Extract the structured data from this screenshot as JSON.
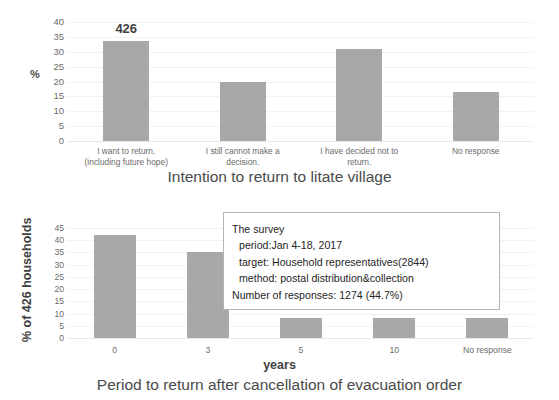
{
  "chart_data": [
    {
      "id": "intention",
      "type": "bar",
      "title": "Intention to return to litate village",
      "xlabel": "",
      "ylabel": "%",
      "ylim": [
        0,
        40
      ],
      "yticks": [
        40,
        35,
        30,
        25,
        20,
        15,
        10,
        5,
        0
      ],
      "grid": true,
      "categories": [
        "I want to return.\n(including future hope)",
        "I still cannot make a\ndecision.",
        "I have decided not to\nreturn.",
        "No response"
      ],
      "category_lines": [
        [
          "I want to return.",
          "(including future hope)"
        ],
        [
          "I still cannot make a",
          "decision."
        ],
        [
          "I have decided not to",
          "return."
        ],
        [
          "No response"
        ]
      ],
      "values": [
        33.5,
        20.0,
        31.0,
        16.5
      ],
      "annotations": [
        {
          "bar_index": 0,
          "text": "426"
        }
      ]
    },
    {
      "id": "period",
      "type": "bar",
      "title": "Period to return after cancellation of evacuation order",
      "xlabel": "years",
      "ylabel": "% of 426 households",
      "ylim": [
        0,
        45
      ],
      "yticks": [
        45,
        40,
        35,
        30,
        25,
        20,
        15,
        10,
        5,
        0
      ],
      "grid": true,
      "categories": [
        "0",
        "3",
        "5",
        "10",
        "No response"
      ],
      "category_lines": [
        [
          "0"
        ],
        [
          "3"
        ],
        [
          "5"
        ],
        [
          "10"
        ],
        [
          "No response"
        ]
      ],
      "values": [
        42.3,
        35.3,
        8.0,
        8.0,
        8.0
      ],
      "annotations": []
    }
  ],
  "survey_box": {
    "heading": "The survey",
    "period_line": "period:Jan 4-18, 2017",
    "target_line": "target: Household representatives(2844)",
    "method_line": "method: postal distribution&collection",
    "responses_line": "Number of responses: 1274 (44.7%)"
  },
  "colors": {
    "bar": "#a8a8a8",
    "gridline": "#f2f2f2",
    "title_text": "#4a4a4a",
    "tick_text": "#6b6b6b",
    "box_border": "#b5b5b5"
  }
}
